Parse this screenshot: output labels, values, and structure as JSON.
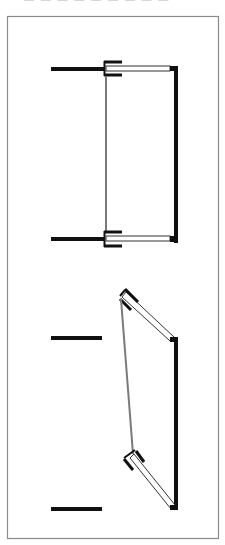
{
  "caption": "— — —  — — —  — — —",
  "colors": {
    "frame": "#8a8a8a",
    "wall": "#111111",
    "panel_outline": "#333333",
    "link_gray": "#7a7a7a",
    "background": "#ffffff"
  },
  "diagram": {
    "frame": {
      "x": 7,
      "y": 16,
      "width": 211,
      "height": 522
    },
    "figures": [
      {
        "name": "closed-state",
        "left_walls": [
          {
            "y": 69
          },
          {
            "y": 239
          }
        ],
        "center_link": {
          "x": 106,
          "y1": 75,
          "y2": 233
        },
        "right_post": {
          "x": 176,
          "y1": 66,
          "y2": 243
        }
      },
      {
        "name": "open-state",
        "left_walls": [
          {
            "y": 338
          },
          {
            "y": 509
          }
        ],
        "center_link": {
          "x1": 121,
          "y1": 297,
          "x2": 133,
          "y2": 455
        },
        "right_post": {
          "x": 176,
          "y1": 338,
          "y2": 509
        }
      }
    ]
  }
}
